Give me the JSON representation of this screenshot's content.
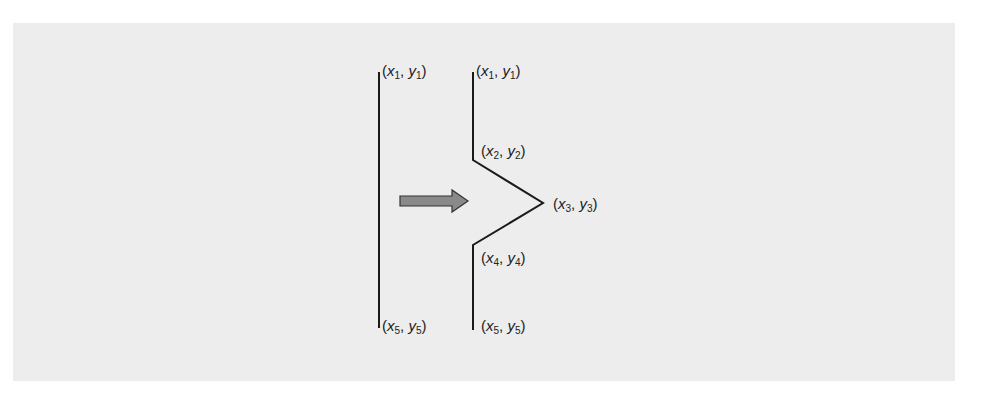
{
  "figure": {
    "background_color": "#ededed",
    "line_color": "#1a1a1a",
    "arrow_fill": "#8a8a8a",
    "arrow_stroke": "#333333",
    "left_polyline": {
      "points": [
        [
          379,
          72
        ],
        [
          379,
          328
        ]
      ],
      "labels": [
        {
          "id": "p1",
          "var_x": "x",
          "sub_x": "1",
          "var_y": "y",
          "sub_y": "1"
        },
        {
          "id": "p5",
          "var_x": "x",
          "sub_x": "5",
          "var_y": "y",
          "sub_y": "5"
        }
      ]
    },
    "right_polyline": {
      "points": [
        [
          473,
          72
        ],
        [
          473,
          160
        ],
        [
          543,
          203
        ],
        [
          473,
          245
        ],
        [
          473,
          330
        ]
      ],
      "labels": [
        {
          "id": "p1",
          "var_x": "x",
          "sub_x": "1",
          "var_y": "y",
          "sub_y": "1"
        },
        {
          "id": "p2",
          "var_x": "x",
          "sub_x": "2",
          "var_y": "y",
          "sub_y": "2"
        },
        {
          "id": "p3",
          "var_x": "x",
          "sub_x": "3",
          "var_y": "y",
          "sub_y": "3"
        },
        {
          "id": "p4",
          "var_x": "x",
          "sub_x": "4",
          "var_y": "y",
          "sub_y": "4"
        },
        {
          "id": "p5",
          "var_x": "x",
          "sub_x": "5",
          "var_y": "y",
          "sub_y": "5"
        }
      ]
    },
    "arrow": {
      "direction": "right",
      "label": "transform-arrow"
    }
  },
  "punct": {
    "open": "(",
    "comma": ", ",
    "close": ")"
  }
}
